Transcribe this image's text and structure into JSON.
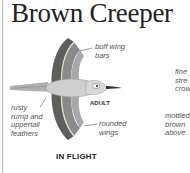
{
  "title": "Brown Creeper",
  "illustration": {
    "section_label": "IN FLIGHT",
    "age_label": "ADULT",
    "annotations": {
      "buff_wing_bars": [
        "buff wing",
        "bars"
      ],
      "rusty_rump": [
        "rusty",
        "rump and",
        "uppertail",
        "feathers"
      ],
      "rounded_wings": [
        "rounded",
        "wings"
      ],
      "fine_streaked_crown": [
        "fine",
        "stre",
        "crow"
      ],
      "mottled_brown_above": [
        "mottled",
        "brown",
        "above"
      ]
    }
  },
  "colors": {
    "wing_dark": "#6a6a6a",
    "wing_mid": "#9a9a9a",
    "body": "#c8c8c8",
    "text": "#555555"
  }
}
